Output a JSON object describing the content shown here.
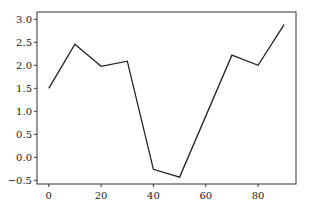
{
  "chart_data": {
    "type": "line",
    "title": "",
    "xlabel": "",
    "ylabel": "",
    "x": [
      0,
      10,
      20,
      30,
      40,
      50,
      70,
      80,
      90
    ],
    "series": [
      {
        "name": "series",
        "values": [
          1.5,
          2.46,
          1.98,
          2.09,
          -0.26,
          -0.43,
          2.22,
          2.0,
          2.89
        ]
      }
    ],
    "xlim": [
      -4.5,
      94.5
    ],
    "ylim": [
      -0.58,
      3.16
    ],
    "xticks": [
      0,
      20,
      40,
      60,
      80
    ],
    "yticks": [
      -0.5,
      0.0,
      0.5,
      1.0,
      1.5,
      2.0,
      2.5,
      3.0
    ],
    "xtick_labels": [
      "0",
      "20",
      "40",
      "60",
      "80"
    ],
    "ytick_labels": [
      "−0.5",
      "0.0",
      "0.5",
      "1.0",
      "1.5",
      "2.0",
      "2.5",
      "3.0"
    ],
    "grid": false,
    "legend": null,
    "line_color": "#222222"
  }
}
